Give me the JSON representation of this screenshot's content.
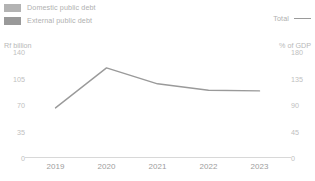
{
  "legend": {
    "domestic_label": "Domestic public debt",
    "external_label": "External public debt",
    "total_label": "Total",
    "domestic_color": "#b5b5b5",
    "external_color": "#9c9c9c",
    "total_color": "#9a9a9a"
  },
  "axes": {
    "left_unit": "Rf billion",
    "right_unit": "% of GDP",
    "left_ticks": [
      "140",
      "105",
      "70",
      "35",
      "0"
    ],
    "right_ticks": [
      "180",
      "135",
      "90",
      "45",
      "0"
    ]
  },
  "chart_data": {
    "type": "bar",
    "title": "",
    "subtitle": "",
    "xlabel": "",
    "ylabel": "Rf billion",
    "y2label": "% of GDP",
    "ylim": [
      0,
      140
    ],
    "y2lim": [
      0,
      180
    ],
    "grid": false,
    "legend_position": "top",
    "categories": [
      "2019",
      "2020",
      "2021",
      "2022",
      "2023"
    ],
    "series": [
      {
        "name": "External public debt",
        "type": "bar",
        "stack": "debt",
        "axis": "left",
        "color": "#9c9c9c",
        "values": [
          35,
          41,
          48,
          56,
          69
        ]
      },
      {
        "name": "Domestic public debt",
        "type": "bar",
        "stack": "debt",
        "axis": "left",
        "color": "#b5b5b5",
        "values": [
          33,
          42,
          40,
          47,
          46
        ]
      },
      {
        "name": "Total",
        "type": "line",
        "axis": "right",
        "color": "#9a9a9a",
        "values": [
          85,
          153,
          126,
          115,
          114
        ]
      }
    ],
    "totals_left_axis": [
      68,
      83,
      88,
      103,
      115
    ]
  }
}
